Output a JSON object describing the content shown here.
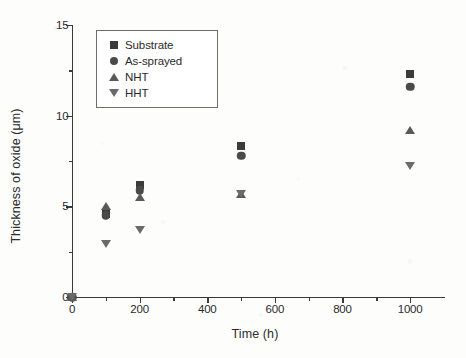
{
  "chart_data": {
    "type": "scatter",
    "title": "",
    "xlabel": "Time (h)",
    "ylabel": "Thickness of oxide (μm)",
    "xlim": [
      0,
      1050
    ],
    "ylim": [
      0,
      15
    ],
    "xticks": [
      0,
      200,
      400,
      600,
      800,
      1000
    ],
    "xticklabels": [
      "0",
      "200",
      "400",
      "600",
      "800",
      "1000"
    ],
    "xminorticks": [
      100,
      300,
      500,
      700,
      900
    ],
    "yticks": [
      0,
      5,
      10,
      15
    ],
    "yticklabels": [
      "0",
      "5",
      "10",
      "15"
    ],
    "yminorticks": [
      2.5,
      7.5,
      12.5
    ],
    "grid": false,
    "legend_position": "upper left",
    "x": [
      0,
      100,
      200,
      500,
      1000
    ],
    "series": [
      {
        "name": "Substrate",
        "marker": "square",
        "color": "#3b3b3b",
        "values": [
          0,
          4.6,
          6.2,
          8.3,
          12.3
        ]
      },
      {
        "name": "As-sprayed",
        "marker": "circle",
        "color": "#4a4a4a",
        "values": [
          0,
          4.5,
          5.9,
          7.8,
          11.6
        ]
      },
      {
        "name": "NHT",
        "marker": "triangle-up",
        "color": "#5a5a5a",
        "values": [
          0,
          5.0,
          5.5,
          5.7,
          9.2
        ]
      },
      {
        "name": "HHT",
        "marker": "triangle-down",
        "color": "#6a6a6a",
        "values": [
          0,
          2.9,
          3.7,
          5.7,
          7.2
        ]
      }
    ]
  },
  "legend": {
    "items": [
      {
        "label": "Substrate",
        "marker": "square"
      },
      {
        "label": "As-sprayed",
        "marker": "circle"
      },
      {
        "label": "NHT",
        "marker": "triangle-up"
      },
      {
        "label": "HHT",
        "marker": "triangle-down"
      }
    ]
  },
  "colors": {
    "axis": "#3a3a3a",
    "text": "#2b2b2b",
    "background": "#fdfdfc",
    "legend_border": "#6d6d6d"
  }
}
